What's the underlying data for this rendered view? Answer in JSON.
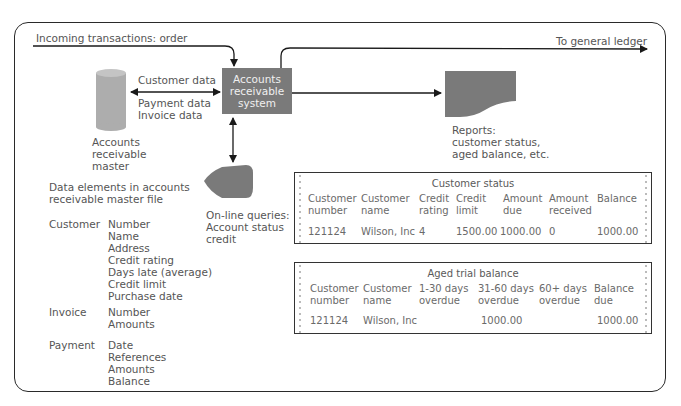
{
  "diagram": {
    "incoming_label": "Incoming transactions: order",
    "outgoing_label": "To general ledger",
    "system_box": [
      "Accounts",
      "receivable",
      "system"
    ],
    "flows": {
      "customer_data": "Customer data",
      "payment_data": "Payment data",
      "invoice_data": "Invoice data"
    },
    "master_file": [
      "Accounts",
      "receivable",
      "master"
    ],
    "reports": [
      "Reports:",
      "customer status,",
      "aged balance, etc."
    ],
    "queries": [
      "On-line queries:",
      "Account status",
      "credit"
    ]
  },
  "data_elements": {
    "heading": [
      "Data elements in accounts",
      "receivable master file"
    ],
    "groups": [
      {
        "name": "Customer",
        "fields": [
          "Number",
          "Name",
          "Address",
          "Credit rating",
          "Days late (average)",
          "Credit limit",
          "Purchase date"
        ]
      },
      {
        "name": "Invoice",
        "fields": [
          "Number",
          "Amounts"
        ]
      },
      {
        "name": "Payment",
        "fields": [
          "Date",
          "References",
          "Amounts",
          "Balance"
        ]
      }
    ]
  },
  "customer_status": {
    "title": "Customer status",
    "headers": [
      [
        "Customer",
        "number"
      ],
      [
        "Customer",
        "name"
      ],
      [
        "Credit",
        "rating"
      ],
      [
        "Credit",
        "limit"
      ],
      [
        "Amount",
        "due"
      ],
      [
        "Amount",
        "received"
      ],
      [
        "Balance",
        ""
      ]
    ],
    "row": [
      "121124",
      "Wilson, Inc",
      "4",
      "1500.00",
      "1000.00",
      "0",
      "1000.00"
    ]
  },
  "aged_trial_balance": {
    "title": "Aged trial balance",
    "headers": [
      [
        "Customer",
        "number"
      ],
      [
        "Customer",
        "name"
      ],
      [
        "1-30 days",
        "overdue"
      ],
      [
        "31-60 days",
        "overdue"
      ],
      [
        "60+ days",
        "overdue"
      ],
      [
        "Balance",
        "due"
      ]
    ],
    "row": [
      "121124",
      "Wilson, Inc",
      "",
      "1000.00",
      "",
      "1000.00"
    ]
  },
  "colors": {
    "shape_fill": "#7a7a7a",
    "cylinder_fill": "#aaaaaa",
    "line": "#1a1a1a",
    "text": "#555555"
  }
}
